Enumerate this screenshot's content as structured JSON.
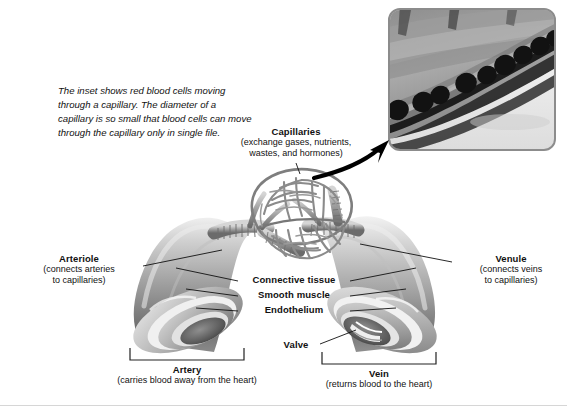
{
  "figure": {
    "background": "#ffffff",
    "width": 567,
    "height": 414
  },
  "caption": {
    "text": "The inset shows red blood cells moving through a capillary. The diameter of a capillary is so small that blood cells can move through the capillary only in single file."
  },
  "inset": {
    "name": "capillary-micrograph",
    "description": "Grayscale micrograph of red blood cells in single file inside a capillary",
    "border_color": "#8c8c8c"
  },
  "labels": {
    "capillaries": {
      "title": "Capillaries",
      "subtitle": "(exchange gases, nutrients,\nwastes, and hormones)"
    },
    "arteriole": {
      "title": "Arteriole",
      "subtitle": "(connects arteries\nto capillaries)"
    },
    "venule": {
      "title": "Venule",
      "subtitle": "(connects veins\nto capillaries)"
    },
    "connective_tissue": {
      "title": "Connective tissue"
    },
    "smooth_muscle": {
      "title": "Smooth muscle"
    },
    "endothelium": {
      "title": "Endothelium"
    },
    "valve": {
      "title": "Valve"
    },
    "artery": {
      "title": "Artery",
      "subtitle": "(carries blood away from the heart)"
    },
    "vein": {
      "title": "Vein",
      "subtitle": "(returns blood to the heart)"
    }
  },
  "colors": {
    "leader_line": "#111111",
    "bracket": "#222222",
    "vessel_dark": "#5d5d5d",
    "vessel_mid": "#9a9a9a",
    "vessel_light": "#d8d8d8",
    "arrow": "#000000"
  }
}
